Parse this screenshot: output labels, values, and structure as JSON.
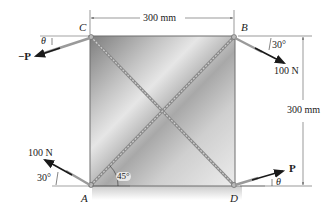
{
  "figure": {
    "type": "statics-problem-diagram"
  },
  "points": {
    "A": "A",
    "B": "B",
    "C": "C",
    "D": "D"
  },
  "dimensions": {
    "width": "300 mm",
    "height": "300 mm"
  },
  "forces": {
    "at_A": {
      "magnitude": "100 N",
      "angle": "30°",
      "direction": "up-left"
    },
    "at_B": {
      "magnitude": "100 N",
      "angle": "30°",
      "direction": "down-right"
    },
    "at_C": {
      "label": "−P",
      "angle": "θ",
      "direction": "down-left"
    },
    "at_D": {
      "label": "P",
      "angle": "θ",
      "direction": "up-right"
    }
  },
  "angles": {
    "cable_angle": "45°"
  },
  "colors": {
    "plate_light": "#d8d8d8",
    "plate_dark": "#8a8a8a",
    "cable": "#9a9a9a",
    "arrow": "#1a1a1a",
    "dim_line": "#555555"
  }
}
